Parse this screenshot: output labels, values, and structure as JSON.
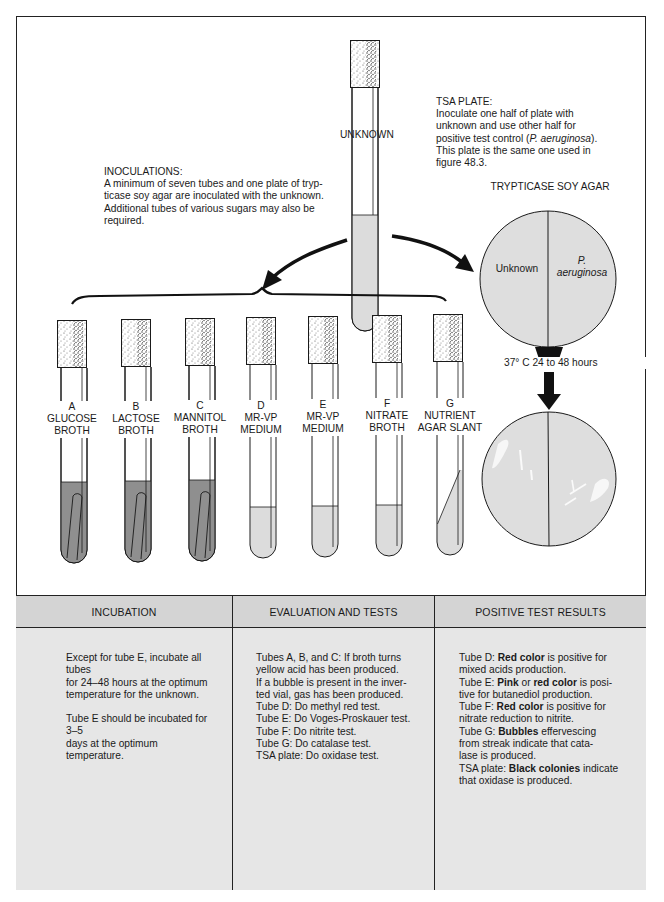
{
  "figure": {
    "unknown_tube_label": "UNKNOWN",
    "inoculations": {
      "heading": "INOCULATIONS:",
      "lines": [
        "A minimum of seven tubes and one plate of tryp-",
        "ticase soy agar are inoculated with the unknown.",
        "Additional tubes of various sugars may also be",
        "required."
      ]
    },
    "tsa_plate": {
      "heading": "TSA PLATE:",
      "lines": [
        "Inoculate one half of plate with",
        "unknown and use other half for",
        "positive test control (",
        "P. aeruginosa",
        ").",
        "This plate is the same one used in",
        "figure 48.3."
      ],
      "line1": "Inoculate one half of plate with",
      "line2": "unknown and use other half for",
      "line3_pre": "positive test control (",
      "line3_italic": "P. aeruginosa",
      "line3_post": ").",
      "line4": "This plate is the same one used in",
      "line5": "figure 48.3."
    },
    "plate_title": "TRYPTICASE SOY AGAR",
    "plate_left_label": "Unknown",
    "plate_right_label_1": "P.",
    "plate_right_label_2": "aeruginosa",
    "incubation_arrow_label": "37° C 24 to 48 hours",
    "tubes": [
      {
        "letter": "A",
        "line1": "GLUCOSE",
        "line2": "BROTH",
        "medium": "dark",
        "durham": true
      },
      {
        "letter": "B",
        "line1": "LACTOSE",
        "line2": "BROTH",
        "medium": "dark",
        "durham": true
      },
      {
        "letter": "C",
        "line1": "MANNITOL",
        "line2": "BROTH",
        "medium": "dark",
        "durham": true
      },
      {
        "letter": "D",
        "line1": "MR-VP",
        "line2": "MEDIUM",
        "medium": "light",
        "durham": false
      },
      {
        "letter": "E",
        "line1": "MR-VP",
        "line2": "MEDIUM",
        "medium": "light",
        "durham": false
      },
      {
        "letter": "F",
        "line1": "NITRATE",
        "line2": "BROTH",
        "medium": "light",
        "durham": false
      },
      {
        "letter": "G",
        "line1": "NUTRIENT",
        "line2": "AGAR SLANT",
        "medium": "slant",
        "durham": false
      }
    ],
    "colors": {
      "dark_broth": "#8f8f8f",
      "light_medium": "#dcdcdc",
      "plate_fill": "#dedede",
      "table_header": "#d4d4d4",
      "table_body": "#e6e6e6",
      "line": "#1a1a1a"
    }
  },
  "table": {
    "columns": [
      {
        "header": "INCUBATION",
        "paragraphs": [
          [
            "Except for tube E, incubate all tubes",
            "for 24–48 hours at the optimum",
            "temperature for the unknown."
          ],
          [
            "Tube E should be incubated for 3–5",
            "days at the optimum temperature."
          ]
        ]
      },
      {
        "header": "EVALUATION AND TESTS",
        "lines": [
          "Tubes A, B, and C: If broth turns",
          "yellow acid has been produced.",
          "If a bubble is present in the inver-",
          "ted vial, gas has been produced.",
          "Tube D: Do methyl red test.",
          "Tube E: Do Voges-Proskauer test.",
          "Tube F: Do nitrite test.",
          "Tube G: Do catalase test.",
          "TSA plate: Do oxidase test."
        ]
      },
      {
        "header": "POSITIVE TEST RESULTS",
        "lines": [
          [
            {
              "t": "Tube D: "
            },
            {
              "t": "Red color",
              "b": true
            },
            {
              "t": " is positive for"
            }
          ],
          [
            {
              "t": "mixed acids production."
            }
          ],
          [
            {
              "t": "Tube E: "
            },
            {
              "t": "Pink",
              "b": true
            },
            {
              "t": " or "
            },
            {
              "t": "red color",
              "b": true
            },
            {
              "t": " is posi-"
            }
          ],
          [
            {
              "t": "tive for butanediol production."
            }
          ],
          [
            {
              "t": "Tube F: "
            },
            {
              "t": "Red color",
              "b": true
            },
            {
              "t": " is positive for"
            }
          ],
          [
            {
              "t": "nitrate reduction to nitrite."
            }
          ],
          [
            {
              "t": "Tube G: "
            },
            {
              "t": "Bubbles",
              "b": true
            },
            {
              "t": " effervescing"
            }
          ],
          [
            {
              "t": "from streak indicate that cata-"
            }
          ],
          [
            {
              "t": "lase is produced."
            }
          ],
          [
            {
              "t": "TSA plate: "
            },
            {
              "t": "Black colonies",
              "b": true
            },
            {
              "t": " indicate"
            }
          ],
          [
            {
              "t": "that oxidase is produced."
            }
          ]
        ]
      }
    ]
  }
}
